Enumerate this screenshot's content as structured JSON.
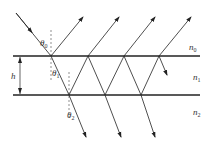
{
  "diagram": {
    "colors": {
      "line": "#222222",
      "label": "#333333",
      "background": "#ffffff"
    },
    "media": [
      {
        "label": "n",
        "sub": "0"
      },
      {
        "label": "n",
        "sub": "1"
      },
      {
        "label": "n",
        "sub": "2"
      }
    ],
    "thickness_label": "h",
    "angles": [
      {
        "label": "θ",
        "sub": "0"
      },
      {
        "label": "θ",
        "sub": "1"
      },
      {
        "label": "θ",
        "sub": "2"
      }
    ],
    "geometry": {
      "top_interface_y": 56,
      "bottom_interface_y": 95,
      "interface_x_range": [
        13,
        200
      ],
      "top_hits_x": [
        51,
        88,
        124,
        159
      ],
      "bottom_hits_x": [
        69,
        105,
        141
      ],
      "reflected_ray_count": 4,
      "transmitted_ray_count": 3
    }
  }
}
